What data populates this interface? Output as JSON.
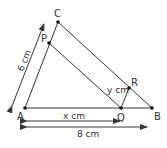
{
  "diagram": {
    "points": {
      "A": {
        "label": "A",
        "x": 25,
        "y": 108
      },
      "B": {
        "label": "B",
        "x": 152,
        "y": 108
      },
      "C": {
        "label": "C",
        "x": 58,
        "y": 22
      },
      "P": {
        "label": "P",
        "x": 49,
        "y": 43
      },
      "Q": {
        "label": "Q",
        "x": 121,
        "y": 108
      },
      "R": {
        "label": "R",
        "x": 129,
        "y": 88
      }
    },
    "dimensions": {
      "AC": "6 cm",
      "AQ": "x cm",
      "AB": "8 cm",
      "QR": "y cm"
    },
    "colors": {
      "line": "#333333",
      "text": "#333333"
    }
  }
}
